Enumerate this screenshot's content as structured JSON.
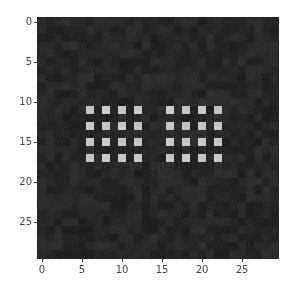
{
  "chart_data": {
    "type": "heatmap",
    "title": "",
    "xlabel": "",
    "ylabel": "",
    "shape": [
      30,
      30
    ],
    "xlim": [
      -0.5,
      29.5
    ],
    "ylim": [
      29.5,
      -0.5
    ],
    "xticks": [
      0,
      5,
      10,
      15,
      20,
      25
    ],
    "yticks": [
      0,
      5,
      10,
      15,
      20,
      25
    ],
    "colormap": "gray",
    "background_value": 0.15,
    "background_noise": 0.03,
    "bright_value": 0.78,
    "bright_cells": {
      "rows": [
        11,
        13,
        15,
        17
      ],
      "cols": [
        6,
        8,
        10,
        12,
        16,
        18,
        20,
        22
      ]
    },
    "groups": [
      {
        "name": "left-block",
        "rows": [
          11,
          13,
          15,
          17
        ],
        "cols": [
          6,
          8,
          10,
          12
        ]
      },
      {
        "name": "right-block",
        "rows": [
          11,
          13,
          15,
          17
        ],
        "cols": [
          16,
          18,
          20,
          22
        ]
      }
    ]
  },
  "colors": {
    "background": "#2b2b2b",
    "bright": "#c8c8c8",
    "tick": "#333333",
    "label": "#444444"
  },
  "axes": {
    "x_tick_labels": [
      "0",
      "5",
      "10",
      "15",
      "20",
      "25"
    ],
    "y_tick_labels": [
      "0",
      "5",
      "10",
      "15",
      "20",
      "25"
    ]
  }
}
